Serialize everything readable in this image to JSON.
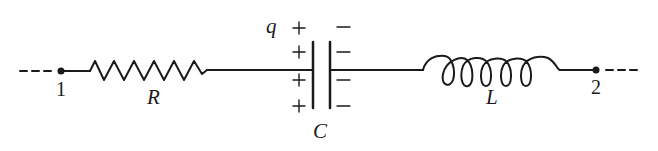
{
  "diagram": {
    "type": "series RLC circuit",
    "nodes": [
      {
        "id": "node-1",
        "label": "1"
      },
      {
        "id": "node-2",
        "label": "2"
      }
    ],
    "components": {
      "resistor": {
        "label": "R"
      },
      "capacitor": {
        "label": "C",
        "charge_label": "q",
        "plus_signs": [
          "+",
          "+",
          "+",
          "+"
        ],
        "minus_signs": [
          "−",
          "−",
          "−",
          "−"
        ]
      },
      "inductor": {
        "label": "L"
      }
    },
    "stroke_color": "#1a1a1a"
  }
}
